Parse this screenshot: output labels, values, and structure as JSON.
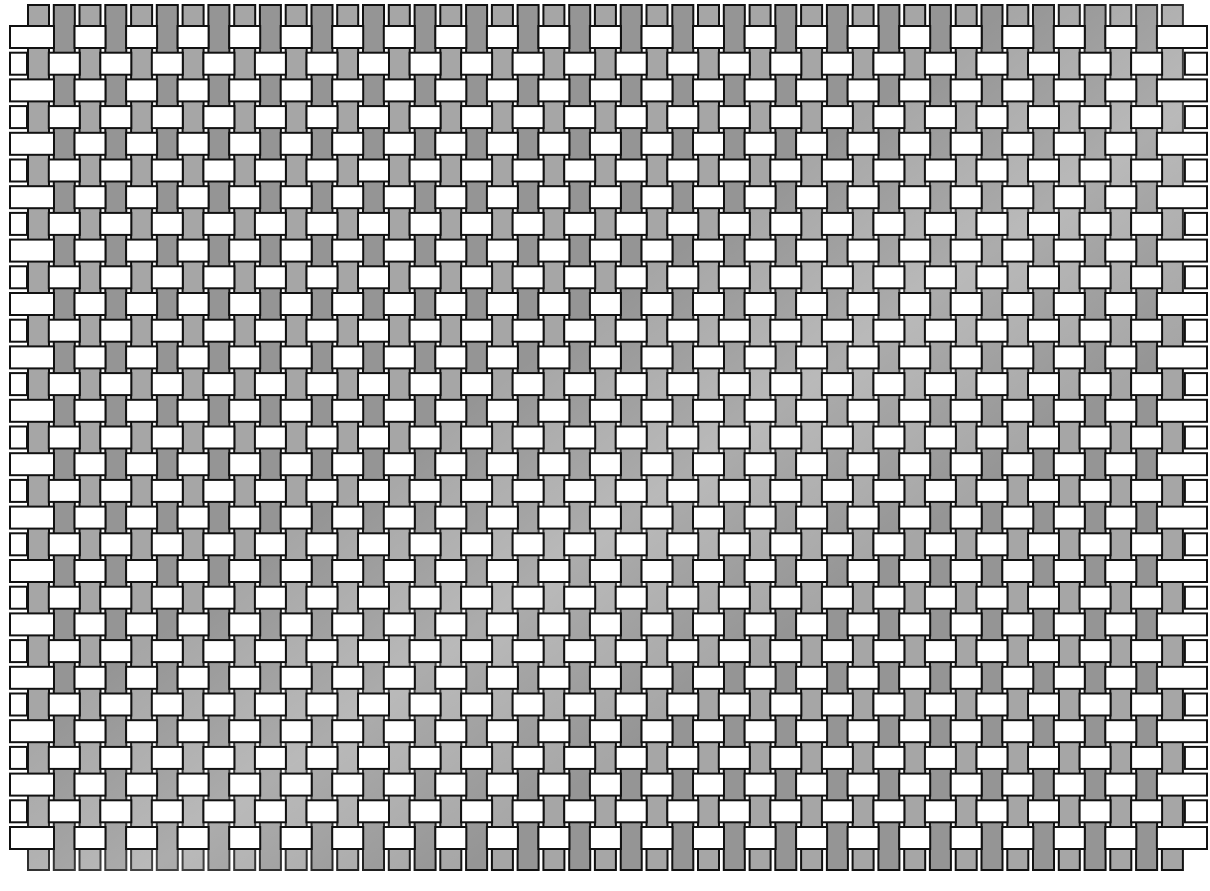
{
  "diagram": {
    "type": "woven strip diagram",
    "warp": {
      "label": "vertical strips",
      "count": 45,
      "x0": 28,
      "pitch": 25.77,
      "width": 21,
      "top": 5,
      "bottom": 870,
      "fill": "#a6a6a6",
      "fill_shadow": "#959595",
      "highlight": "#c8c8c8"
    },
    "weft": {
      "label": "horizontal strips",
      "count": 31,
      "y0": 26,
      "pitch": 26.7,
      "height": 22,
      "left": 10,
      "right": 1207,
      "fill": "#ffffff",
      "over_margin": 5
    },
    "stroke": "#111111",
    "background": "#ffffff"
  }
}
